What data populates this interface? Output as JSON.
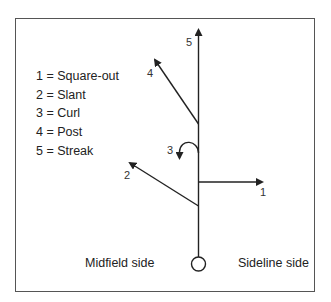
{
  "legend": {
    "items": [
      {
        "num": "1",
        "name": "Square-out",
        "text": "1 = Square-out"
      },
      {
        "num": "2",
        "name": "Slant",
        "text": "2 = Slant"
      },
      {
        "num": "3",
        "name": "Curl",
        "text": "3 = Curl"
      },
      {
        "num": "4",
        "name": "Post",
        "text": "4 = Post"
      },
      {
        "num": "5",
        "name": "Streak",
        "text": "5 = Streak"
      }
    ]
  },
  "route_labels": {
    "r1": "1",
    "r2": "2",
    "r3": "3",
    "r4": "4",
    "r5": "5"
  },
  "sides": {
    "left": "Midfield side",
    "right": "Sideline side"
  },
  "colors": {
    "line": "#222222",
    "frame": "#555555"
  }
}
